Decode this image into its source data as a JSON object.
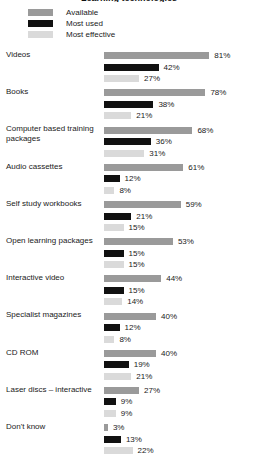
{
  "chart_data": {
    "type": "bar",
    "orientation": "horizontal",
    "title": "Learning technologies",
    "xlabel": "",
    "ylabel": "",
    "xlim": [
      0,
      100
    ],
    "grid": false,
    "legend_position": "top-left",
    "value_suffix": "%",
    "categories": [
      "Videos",
      "Books",
      "Computer based training packages",
      "Audio cassettes",
      "Self study workbooks",
      "Open learning packages",
      "Interactive video",
      "Specialist magazines",
      "CD ROM",
      "Laser discs – interactive",
      "Don't know"
    ],
    "series": [
      {
        "name": "Available",
        "color": "#9a9a9a",
        "values": [
          81,
          78,
          68,
          61,
          59,
          53,
          44,
          40,
          40,
          27,
          3
        ]
      },
      {
        "name": "Most used",
        "color": "#111111",
        "values": [
          42,
          38,
          36,
          12,
          21,
          15,
          15,
          12,
          19,
          9,
          13
        ]
      },
      {
        "name": "Most effective",
        "color": "#dadada",
        "values": [
          27,
          21,
          31,
          8,
          15,
          15,
          14,
          8,
          21,
          9,
          22
        ]
      }
    ],
    "labels": [
      {
        "category": "Videos",
        "values": [
          "81%",
          "42%",
          "27%"
        ]
      },
      {
        "category": "Books",
        "values": [
          "78%",
          "38%",
          "21%"
        ]
      },
      {
        "category": "Computer based training packages",
        "values": [
          "68%",
          "36%",
          "31%"
        ]
      },
      {
        "category": "Audio cassettes",
        "values": [
          "61%",
          "12%",
          "8%"
        ]
      },
      {
        "category": "Self study workbooks",
        "values": [
          "59%",
          "21%",
          "15%"
        ]
      },
      {
        "category": "Open learning packages",
        "values": [
          "53%",
          "15%",
          "15%"
        ]
      },
      {
        "category": "Interactive video",
        "values": [
          "44%",
          "15%",
          "14%"
        ]
      },
      {
        "category": "Specialist magazines",
        "values": [
          "40%",
          "12%",
          "8%"
        ]
      },
      {
        "category": "CD ROM",
        "values": [
          "40%",
          "19%",
          "21%"
        ]
      },
      {
        "category": "Laser discs – interactive",
        "values": [
          "27%",
          "9%",
          "9%"
        ]
      },
      {
        "category": "Don't know",
        "values": [
          "3%",
          "13%",
          "22%"
        ]
      }
    ]
  },
  "legend": {
    "items": [
      {
        "label": "Available",
        "color": "#9a9a9a"
      },
      {
        "label": "Most used",
        "color": "#111111"
      },
      {
        "label": "Most effective",
        "color": "#dadada"
      }
    ]
  }
}
